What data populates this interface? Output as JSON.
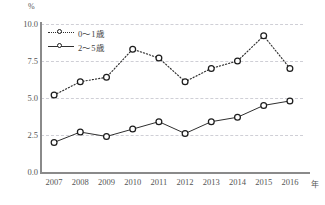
{
  "chart_data": {
    "type": "line",
    "title": "",
    "subtitle": "",
    "xlabel": "年",
    "ylabel": "%",
    "categories": [
      "2007",
      "2008",
      "2009",
      "2010",
      "2011",
      "2012",
      "2013",
      "2014",
      "2015",
      "2016"
    ],
    "x": [
      2007,
      2008,
      2009,
      2010,
      2011,
      2012,
      2013,
      2014,
      2015,
      2016
    ],
    "series": [
      {
        "name": "0～1歳",
        "values": [
          5.2,
          6.1,
          6.4,
          8.3,
          7.7,
          6.1,
          7.0,
          7.5,
          9.2,
          7.0
        ],
        "line_style": "dotted",
        "marker": "open-circle",
        "color": "#2f2f2f"
      },
      {
        "name": "2～5歳",
        "values": [
          2.0,
          2.7,
          2.4,
          2.9,
          3.4,
          2.6,
          3.4,
          3.7,
          4.5,
          4.8
        ],
        "line_style": "solid",
        "marker": "open-circle",
        "color": "#2f2f2f"
      }
    ],
    "ylim": [
      0.0,
      10.0
    ],
    "y_ticks": [
      "0.0",
      "2.5",
      "5.0",
      "7.5",
      "10.0"
    ],
    "y_tick_values": [
      0.0,
      2.5,
      5.0,
      7.5,
      10.0
    ],
    "grid": true,
    "grid_axis": "y",
    "grid_style": "dashed",
    "legend_position": "top-left-inside",
    "axis_color": "#8a8a8a",
    "grid_color": "#cfcfd6",
    "background": "#ffffff"
  },
  "axes": {
    "y_unit": "%",
    "x_unit": "年"
  }
}
